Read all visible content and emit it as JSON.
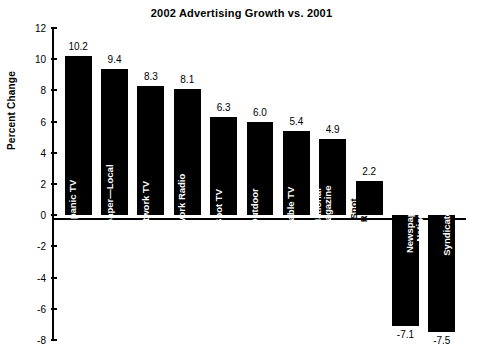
{
  "chart_data": {
    "type": "bar",
    "title": "2002 Advertising Growth vs. 2001",
    "xlabel": "",
    "ylabel": "Percent Change",
    "ylim": [
      -8,
      12
    ],
    "yticks": [
      12,
      10,
      8,
      6,
      4,
      2,
      0,
      -2,
      -4,
      -6,
      -8
    ],
    "ytick_labels": [
      "12",
      "10",
      "8",
      "6",
      "4",
      "2",
      "0",
      "-2",
      "-4",
      "-6",
      "-8"
    ],
    "grid": false,
    "legend": "none",
    "bar_color": "#000000",
    "categories": [
      "Hispanic TV",
      "Newspaper—Local",
      "Network TV",
      "Network Radio",
      "Spot TV",
      "Outdoor",
      "Cable TV",
      "National Magazine",
      "Spot Radio",
      "Newspaper—National",
      "Syndicated TV"
    ],
    "values": [
      10.2,
      9.4,
      8.3,
      8.1,
      6.3,
      6.0,
      5.4,
      4.9,
      2.2,
      -7.1,
      -7.5
    ],
    "value_labels": [
      "10.2",
      "9.4",
      "8.3",
      "8.1",
      "6.3",
      "6.0",
      "5.4",
      "4.9",
      "2.2",
      "-7.1",
      "-7.5"
    ],
    "category_lines": [
      [
        "Hispanic TV"
      ],
      [
        "Newspaper—Local"
      ],
      [
        "Network TV"
      ],
      [
        "Network Radio"
      ],
      [
        "Spot TV"
      ],
      [
        "Outdoor"
      ],
      [
        "Cable TV"
      ],
      [
        "National",
        "Magazine"
      ],
      [
        "Spot",
        "Radio"
      ],
      [
        "Newspaper—",
        "National"
      ],
      [
        "Syndicated TV"
      ]
    ]
  }
}
